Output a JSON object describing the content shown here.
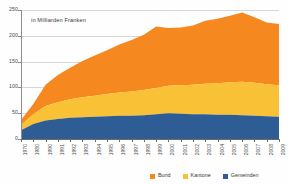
{
  "note": "in Milliarden Franken",
  "colors": {
    "bund": "#F5881F",
    "kantone": "#F9C135",
    "gemeinden": "#2E5C94",
    "axis": "#6d6d6d",
    "grid": "#d7d7d7",
    "text": "#4a4a4a",
    "background": "#fefefe"
  },
  "legend": {
    "position": "bottom-right",
    "items": [
      {
        "label": "Bund",
        "color": "#F5881F"
      },
      {
        "label": "Kantone",
        "color": "#F9C135"
      },
      {
        "label": "Gemeinden",
        "color": "#2E5C94"
      }
    ]
  },
  "chart_data": {
    "type": "area",
    "title": "",
    "subtitle": "in Milliarden Franken",
    "xlabel": "",
    "ylabel": "",
    "ylim": [
      0,
      250
    ],
    "yticks": [
      0,
      50,
      100,
      150,
      200,
      250
    ],
    "ytick_labels": [
      "0",
      "50",
      "100",
      "150",
      "200",
      "250"
    ],
    "grid": true,
    "stacked": true,
    "stack_order": [
      "Gemeinden",
      "Kantone",
      "Bund"
    ],
    "categories": [
      "1970",
      "1980",
      "1990",
      "1991",
      "1992",
      "1993",
      "1994",
      "1995",
      "1996",
      "1997",
      "1998",
      "1999",
      "2000",
      "2001",
      "2002",
      "2003",
      "2004",
      "2005",
      "2006",
      "2007",
      "2008",
      "2009"
    ],
    "series": [
      {
        "name": "Gemeinden",
        "color": "#2E5C94",
        "values": [
          17,
          29,
          36,
          39,
          41,
          42,
          43,
          44,
          45,
          45,
          46,
          48,
          50,
          49,
          48,
          48,
          47,
          47,
          46,
          45,
          44,
          43
        ]
      },
      {
        "name": "Kantone",
        "color": "#F9C135",
        "values": [
          10,
          19,
          28,
          32,
          36,
          39,
          41,
          43,
          45,
          47,
          49,
          51,
          53,
          55,
          57,
          59,
          61,
          63,
          65,
          64,
          62,
          61
        ]
      },
      {
        "name": "Bund",
        "color": "#F5881F",
        "values": [
          10,
          20,
          41,
          53,
          61,
          70,
          78,
          85,
          93,
          100,
          107,
          119,
          112,
          112,
          115,
          122,
          125,
          129,
          134,
          127,
          120,
          119
        ]
      }
    ],
    "totals": [
      37,
      68,
      105,
      124,
      138,
      151,
      162,
      172,
      183,
      192,
      202,
      218,
      215,
      216,
      220,
      229,
      233,
      239,
      245,
      236,
      226,
      223
    ]
  },
  "axis": {
    "y_min_label": "0",
    "y_max_label": "250"
  }
}
